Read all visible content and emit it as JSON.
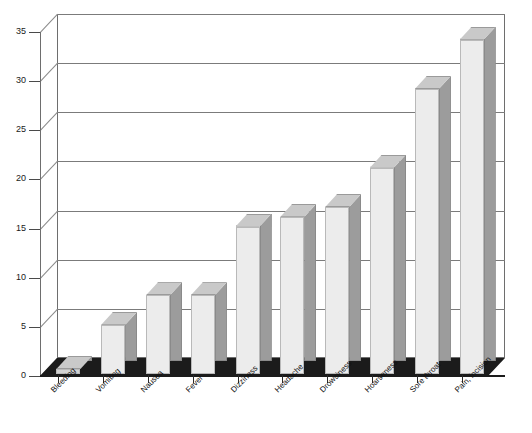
{
  "chart_data": {
    "type": "bar",
    "title": "",
    "subtitle": "",
    "xlabel": "",
    "ylabel": "",
    "ylim": [
      0,
      35
    ],
    "yticks": [
      0,
      5,
      10,
      15,
      20,
      25,
      30,
      35
    ],
    "grid": true,
    "legend": "none",
    "style": "3d-column",
    "categories": [
      "Bleeding",
      "Vomiting",
      "Nausea",
      "Fever",
      "Dizziness",
      "Headache",
      "Drowsiness",
      "Hoarseness",
      "Sore throat",
      "Pain, incision"
    ],
    "values": [
      0,
      5,
      8,
      8,
      15,
      16,
      17,
      21,
      29,
      34
    ],
    "series": [
      {
        "name": "Frequency",
        "values": [
          0,
          5,
          8,
          8,
          15,
          16,
          17,
          21,
          29,
          34
        ]
      }
    ]
  },
  "colors": {
    "bar_front": "#ececec",
    "bar_side": "#9c9c9c",
    "bar_top": "#c9c9c9",
    "floor": "#1b1b1b",
    "grid": "#7b7b7b",
    "axis": "#4a4a4a",
    "background": "#ffffff",
    "text": "#111111"
  }
}
